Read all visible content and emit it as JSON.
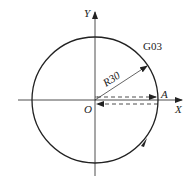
{
  "diagram": {
    "type": "cnc-circular-interpolation",
    "command_label": "G03",
    "radius_label": "R30",
    "origin_label": "O",
    "point_label": "A",
    "x_axis_label": "X",
    "y_axis_label": "Y",
    "direction": "counter-clockwise",
    "colors": {
      "line": "#222222",
      "background": "#ffffff"
    }
  }
}
